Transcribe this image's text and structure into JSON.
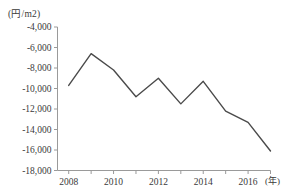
{
  "chart_data": {
    "type": "line",
    "title": "",
    "subtitle": "",
    "xlabel": "(年)",
    "ylabel": "(円/m2)",
    "unit_label": "(円/m2)",
    "x_unit_label": "(年)",
    "grid": false,
    "legend": null,
    "legend_position": "none",
    "line_color": "#4a4a4a",
    "axis_color": "#9a9a9a",
    "xlim": [
      2007.5,
      2017.0
    ],
    "ylim": [
      -18000,
      -4000
    ],
    "y_ticks": [
      -4000,
      -6000,
      -8000,
      -10000,
      -12000,
      -14000,
      -16000,
      -18000
    ],
    "y_tick_labels": [
      "-4,000",
      "-6,000",
      "-8,000",
      "-10,000",
      "-12,000",
      "-14,000",
      "-16,000",
      "-18,000"
    ],
    "x_ticks": [
      2008,
      2009,
      2010,
      2011,
      2012,
      2013,
      2014,
      2015,
      2016,
      2017
    ],
    "x_tick_labels": [
      "2008",
      "",
      "2010",
      "",
      "2012",
      "",
      "2014",
      "",
      "2016",
      ""
    ],
    "x_major_labels": [
      "2008",
      "2010",
      "2012",
      "2014",
      "2016"
    ],
    "x": [
      2008,
      2009,
      2010,
      2011,
      2012,
      2013,
      2014,
      2015,
      2016,
      2017
    ],
    "values": [
      -9700,
      -6600,
      -8200,
      -10800,
      -9000,
      -11500,
      -9300,
      -12200,
      -13300,
      -16100
    ],
    "series": [
      {
        "name": "",
        "x": [
          2008,
          2009,
          2010,
          2011,
          2012,
          2013,
          2014,
          2015,
          2016,
          2017
        ],
        "values": [
          -9700,
          -6600,
          -8200,
          -10800,
          -9000,
          -11500,
          -9300,
          -12200,
          -13300,
          -16100
        ]
      }
    ]
  },
  "axis": {
    "y_unit": "(円/m2)",
    "x_unit": "(年)"
  }
}
